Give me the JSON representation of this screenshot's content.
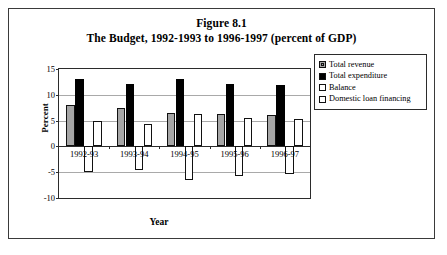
{
  "figure": {
    "title_line1": "Figure 8.1",
    "title_line2": "The Budget, 1992-1993 to 1996-1997 (percent of GDP)"
  },
  "chart_data": {
    "type": "bar",
    "title": "The Budget, 1992-1993 to 1996-1997 (percent of GDP)",
    "xlabel": "Year",
    "ylabel": "Percent",
    "ylim": [
      -10,
      15
    ],
    "yticks": [
      15,
      10,
      5,
      0,
      -5,
      -10
    ],
    "grid": true,
    "legend_position": "right",
    "categories": [
      "1992-93",
      "1993-94",
      "1994-95",
      "1995-96",
      "1996-97"
    ],
    "series": [
      {
        "name": "Total revenue",
        "color": "#a6a6a6",
        "values": [
          8.0,
          7.4,
          6.5,
          6.2,
          6.0
        ]
      },
      {
        "name": "Total expenditure",
        "color": "#000000",
        "values": [
          13.0,
          12.0,
          13.1,
          12.0,
          11.9
        ]
      },
      {
        "name": "Balance",
        "color": "#ffffff",
        "values": [
          -5.0,
          -4.6,
          -6.6,
          -5.7,
          -5.3
        ]
      },
      {
        "name": "Domestic loan financing",
        "color": "#ffffff",
        "values": [
          5.0,
          4.4,
          6.3,
          5.5,
          5.3
        ]
      }
    ]
  }
}
